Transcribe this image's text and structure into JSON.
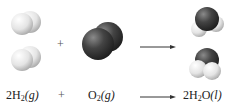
{
  "reaction": {
    "reactant1": {
      "coef": "2",
      "formula": "H",
      "sub": "2",
      "state": "(g)"
    },
    "operator": "+",
    "reactant2": {
      "coef": "",
      "formula": "O",
      "sub": "2",
      "state": "(g)"
    },
    "product": {
      "coef": "2",
      "formula": "H",
      "sub": "2",
      "formula2": "O",
      "state": "(l)"
    }
  },
  "models": {
    "hydrogen_color": "#e6e6e6",
    "oxygen_color": "#3a3a3a",
    "h2_count": 2,
    "o2_count": 1,
    "h2o_count": 2
  }
}
